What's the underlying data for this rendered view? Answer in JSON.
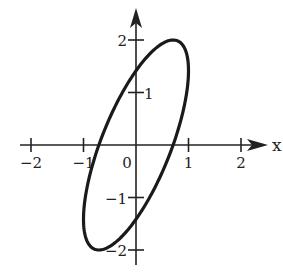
{
  "chart_data": {
    "type": "line",
    "title": "",
    "xlabel": "x",
    "ylabel": "y",
    "xlim": [
      -2.2,
      2.6
    ],
    "ylim": [
      -2.2,
      2.6
    ],
    "grid": false,
    "legend": null,
    "x_ticks": [
      -2,
      -1,
      0,
      1,
      2
    ],
    "x_tick_labels": [
      "−2",
      "−1",
      "0",
      "1",
      "2"
    ],
    "y_ticks": [
      -2,
      -1,
      1,
      2
    ],
    "y_tick_labels": [
      "−2",
      "−1",
      "1",
      "2"
    ],
    "series": [
      {
        "name": "ellipse",
        "parametric": "x = cos(t), y = 2 sin(t + π/4), 0 ≤ t ≤ 2π",
        "key_points": [
          {
            "label": "top",
            "x": 0.71,
            "y": 2.0
          },
          {
            "label": "bottom",
            "x": -0.71,
            "y": -2.0
          },
          {
            "label": "right",
            "x": 1.0,
            "y": 1.41
          },
          {
            "label": "left",
            "x": -1.0,
            "y": -1.41
          },
          {
            "label": "y-intercept upper",
            "x": 0,
            "y": 1.41
          },
          {
            "label": "y-intercept lower",
            "x": 0,
            "y": -1.41
          },
          {
            "label": "x-intercept right",
            "x": 0.71,
            "y": 0
          },
          {
            "label": "x-intercept left",
            "x": -0.71,
            "y": 0
          }
        ],
        "color": "#1a1a1a"
      }
    ]
  },
  "axes": {
    "x_label": "x",
    "origin_label": "0",
    "colors": {
      "axis": "#222222",
      "curve": "#1a1a1a"
    }
  }
}
